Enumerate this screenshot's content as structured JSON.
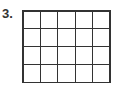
{
  "problem": {
    "number_label": "3.",
    "grid": {
      "rows": 4,
      "columns": 5,
      "line_color": "#333333"
    }
  }
}
